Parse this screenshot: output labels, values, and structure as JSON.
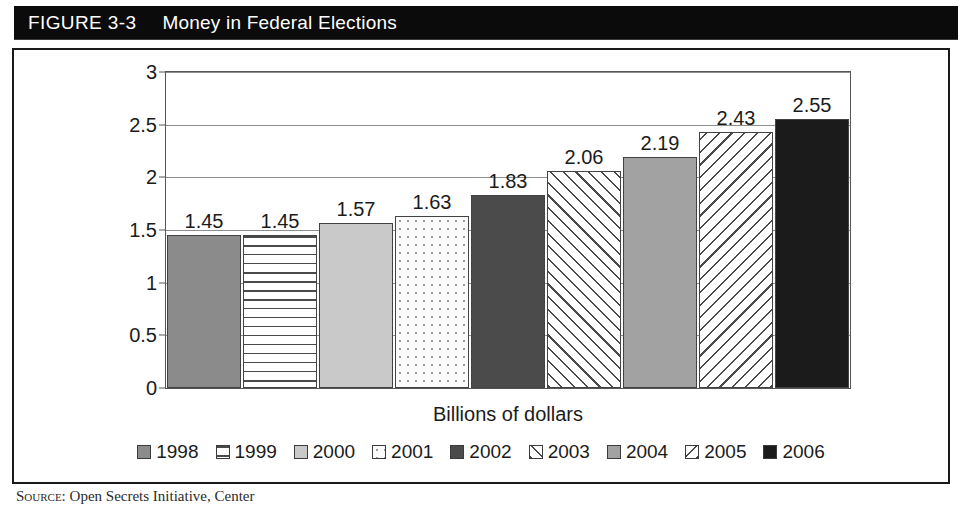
{
  "figure": {
    "number": "FIGURE 3-3",
    "title": "Money in Federal Elections"
  },
  "source": {
    "label": "Source:",
    "text": "Open Secrets Initiative, Center"
  },
  "chart_data": {
    "type": "bar",
    "title": "Money in Federal Elections",
    "xlabel": "Billions of dollars",
    "ylabel": "",
    "ylim": [
      0,
      3
    ],
    "ytick_labels": [
      "0",
      "0.5",
      "1",
      "1.5",
      "2",
      "2.5",
      "3"
    ],
    "ytick_values": [
      0,
      0.5,
      1,
      1.5,
      2,
      2.5,
      3
    ],
    "grid": true,
    "legend_position": "bottom",
    "categories": [
      "1998",
      "1999",
      "2000",
      "2001",
      "2002",
      "2003",
      "2004",
      "2005",
      "2006"
    ],
    "values": [
      1.45,
      1.45,
      1.57,
      1.63,
      1.83,
      2.06,
      2.19,
      2.43,
      2.55
    ],
    "value_labels": [
      "1.45",
      "1.45",
      "1.57",
      "1.63",
      "1.83",
      "2.06",
      "2.19",
      "2.43",
      "2.55"
    ],
    "bars": [
      {
        "category": "1998",
        "value": 1.45,
        "label": "1.45",
        "fill": "solid-med",
        "color": "#8b8b8b"
      },
      {
        "category": "1999",
        "value": 1.45,
        "label": "1.45",
        "fill": "hstripe",
        "color": "#ffffff"
      },
      {
        "category": "2000",
        "value": 1.57,
        "label": "1.57",
        "fill": "solid-light",
        "color": "#c9c9c9"
      },
      {
        "category": "2001",
        "value": 1.63,
        "label": "1.63",
        "fill": "dots",
        "color": "#fbfbfb"
      },
      {
        "category": "2002",
        "value": 1.83,
        "label": "1.83",
        "fill": "solid-dark",
        "color": "#4b4b4b"
      },
      {
        "category": "2003",
        "value": 2.06,
        "label": "2.06",
        "fill": "bslash",
        "color": "#ffffff"
      },
      {
        "category": "2004",
        "value": 2.19,
        "label": "2.19",
        "fill": "solid-med2",
        "color": "#a2a2a2"
      },
      {
        "category": "2005",
        "value": 2.43,
        "label": "2.43",
        "fill": "fslash",
        "color": "#ffffff"
      },
      {
        "category": "2006",
        "value": 2.55,
        "label": "2.55",
        "fill": "solid-black",
        "color": "#1b1b1b"
      }
    ],
    "legend": [
      {
        "label": "1998",
        "fill": "solid-med"
      },
      {
        "label": "1999",
        "fill": "hstripe"
      },
      {
        "label": "2000",
        "fill": "solid-light"
      },
      {
        "label": "2001",
        "fill": "dots"
      },
      {
        "label": "2002",
        "fill": "solid-dark"
      },
      {
        "label": "2003",
        "fill": "bslash"
      },
      {
        "label": "2004",
        "fill": "solid-med2"
      },
      {
        "label": "2005",
        "fill": "fslash"
      },
      {
        "label": "2006",
        "fill": "solid-black"
      }
    ]
  }
}
